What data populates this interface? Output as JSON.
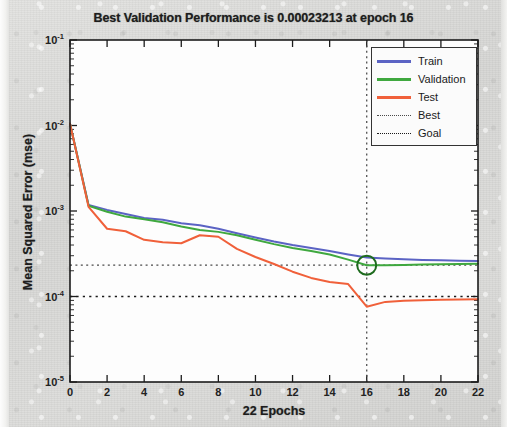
{
  "figure": {
    "title": "Best Validation Performance is 0.00023213 at epoch 16",
    "xlabel": "22 Epochs",
    "ylabel": "Mean Squared Error  (mse)"
  },
  "legend": {
    "items": [
      {
        "label": "Train",
        "color": "#5b63c4",
        "style": "solid"
      },
      {
        "label": "Validation",
        "color": "#3fa83f",
        "style": "solid"
      },
      {
        "label": "Test",
        "color": "#f0603a",
        "style": "solid"
      },
      {
        "label": "Best",
        "color": "#4a4a4a",
        "style": "dotted"
      },
      {
        "label": "Goal",
        "color": "#1a1a1a",
        "style": "dotted"
      }
    ]
  },
  "axes": {
    "y_ticks": [
      {
        "mantissa": "10",
        "exponent": "-1"
      },
      {
        "mantissa": "10",
        "exponent": "-2"
      },
      {
        "mantissa": "10",
        "exponent": "-3"
      },
      {
        "mantissa": "10",
        "exponent": "-4"
      },
      {
        "mantissa": "10",
        "exponent": "-5"
      }
    ],
    "x_ticks": [
      "0",
      "2",
      "4",
      "6",
      "8",
      "10",
      "12",
      "14",
      "16",
      "18",
      "20",
      "22"
    ]
  },
  "chart_data": {
    "type": "line",
    "title": "Best Validation Performance is 0.00023213 at epoch 16",
    "xlabel": "22 Epochs",
    "ylabel": "Mean Squared Error  (mse)",
    "yscale": "log",
    "xlim": [
      0,
      22
    ],
    "ylim": [
      1e-05,
      0.1
    ],
    "grid": false,
    "legend_position": "upper-right",
    "best_epoch": 16,
    "best_value": 0.00023213,
    "goal_value": 0.0001,
    "best_marker": {
      "epoch": 16,
      "value": 0.00023213,
      "color": "#1e6b1e",
      "shape": "circle"
    },
    "x": [
      0,
      1,
      2,
      3,
      4,
      5,
      6,
      7,
      8,
      9,
      10,
      11,
      12,
      13,
      14,
      15,
      16,
      17,
      18,
      19,
      20,
      21,
      22
    ],
    "series": [
      {
        "name": "Train",
        "color": "#5b63c4",
        "values": [
          0.0105,
          0.00118,
          0.00103,
          0.00092,
          0.00083,
          0.00079,
          0.00072,
          0.00068,
          0.00062,
          0.00055,
          0.00049,
          0.00044,
          0.0004,
          0.00037,
          0.00034,
          0.00031,
          0.000285,
          0.000278,
          0.000272,
          0.000268,
          0.000265,
          0.000262,
          0.00026
        ]
      },
      {
        "name": "Validation",
        "color": "#3fa83f",
        "values": [
          0.0105,
          0.00115,
          0.00098,
          0.00086,
          0.0008,
          0.00074,
          0.00066,
          0.0006,
          0.00057,
          0.00052,
          0.00046,
          0.00041,
          0.00037,
          0.00034,
          0.00031,
          0.00027,
          0.00023213,
          0.000232,
          0.000234,
          0.000236,
          0.000238,
          0.00024,
          0.000241
        ]
      },
      {
        "name": "Test",
        "color": "#f0603a",
        "values": [
          0.0105,
          0.00112,
          0.00062,
          0.00058,
          0.00046,
          0.00043,
          0.00042,
          0.00052,
          0.0005,
          0.00036,
          0.00029,
          0.00024,
          0.000195,
          0.000165,
          0.000148,
          0.00014,
          7.6e-05,
          8.65e-05,
          8.9e-05,
          9.05e-05,
          9.15e-05,
          9.25e-05,
          9.3e-05
        ]
      }
    ]
  }
}
